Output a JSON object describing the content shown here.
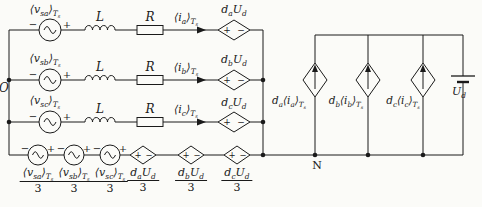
{
  "colors": {
    "ink": "#1a1a1a",
    "paper": "#fbfbf8"
  },
  "labels": {
    "node_o": "O",
    "node_n": "N",
    "inductor": "L",
    "resistor": "R",
    "plus": "+",
    "minus": "−",
    "phase_sources": [
      "⟨v_{sa}⟩_{T_{s}}",
      "⟨v_{sb}⟩_{T_{s}}",
      "⟨v_{sc}⟩_{T_{s}}"
    ],
    "phase_currents": [
      "⟨i_{a}⟩_{T_{s}}",
      "⟨i_{b}⟩_{T_{s}}",
      "⟨i_{c}⟩_{T_{s}}"
    ],
    "phase_cvs": [
      "d_{a}U_{d}",
      "d_{b}U_{d}",
      "d_{c}U_{d}"
    ],
    "dc_ccs": [
      "d_{a}⟨i_{a}⟩_{T_{s}}",
      "d_{b}⟨i_{b}⟩_{T_{s}}",
      "d_{c}⟨i_{c}⟩_{T_{s}}"
    ],
    "dc_voltage": "U_{d}",
    "cm_fractions": [
      {
        "num": "⟨v_{sa}⟩_{T_{s}}",
        "den": "3"
      },
      {
        "num": "⟨v_{sb}⟩_{T_{s}}",
        "den": "3"
      },
      {
        "num": "⟨v_{sc}⟩_{T_{s}}",
        "den": "3"
      },
      {
        "num": "d_{a}U_{d}",
        "den": "3"
      },
      {
        "num": "d_{b}U_{d}",
        "den": "3"
      },
      {
        "num": "d_{c}U_{d}",
        "den": "3"
      }
    ]
  }
}
